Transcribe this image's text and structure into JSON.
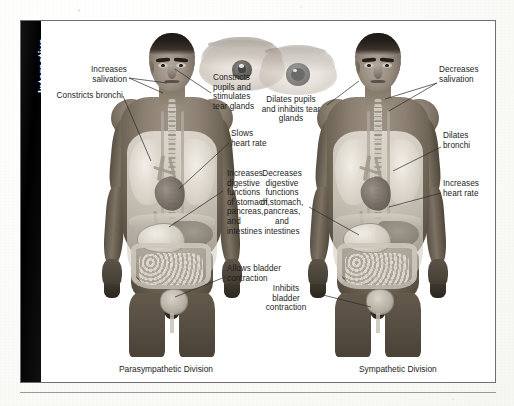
{
  "figure": {
    "tab_label": "Interactive",
    "captions": {
      "left": "Parasympathetic Division",
      "right": "Sympathetic Division"
    }
  },
  "parasympathetic_labels": [
    {
      "id": "increases-salivation",
      "text": "Increases\nsalivation"
    },
    {
      "id": "constricts-bronchi",
      "text": "Constricts bronchi"
    },
    {
      "id": "constricts-pupils",
      "text": "Constricts\npupils and\nstimulates\ntear glands"
    },
    {
      "id": "slows-heart-rate",
      "text": "Slows\nheart rate"
    },
    {
      "id": "increases-digestive",
      "text": "Increases\ndigestive\nfunctions\nof stomach,\npancreas,\nand\nintestines"
    },
    {
      "id": "allows-bladder",
      "text": "Allows bladder\ncontraction"
    }
  ],
  "sympathetic_labels": [
    {
      "id": "dilates-pupils",
      "text": "Dilates pupils\nand inhibits tear\nglands"
    },
    {
      "id": "decreases-salivation",
      "text": "Decreases\nsalivation"
    },
    {
      "id": "dilates-bronchi",
      "text": "Dilates\nbronchi"
    },
    {
      "id": "increases-heart-rate",
      "text": "Increases\nheart rate"
    },
    {
      "id": "decreases-digestive",
      "text": "Decreases\ndigestive\nfunctions\nof stomach,\npancreas,\nand\nintestines"
    },
    {
      "id": "inhibits-bladder",
      "text": "Inhibits\nbladder\ncontraction"
    }
  ],
  "colors": {
    "page_background": "#fdfdfb",
    "frame_border": "#6e6e6e",
    "tab_background": "#0a0a0a",
    "tab_text": "#ffffff",
    "label_text": "#1c1c1c",
    "leader_line": "#2a2a2a",
    "rule": "#9a9a96"
  }
}
